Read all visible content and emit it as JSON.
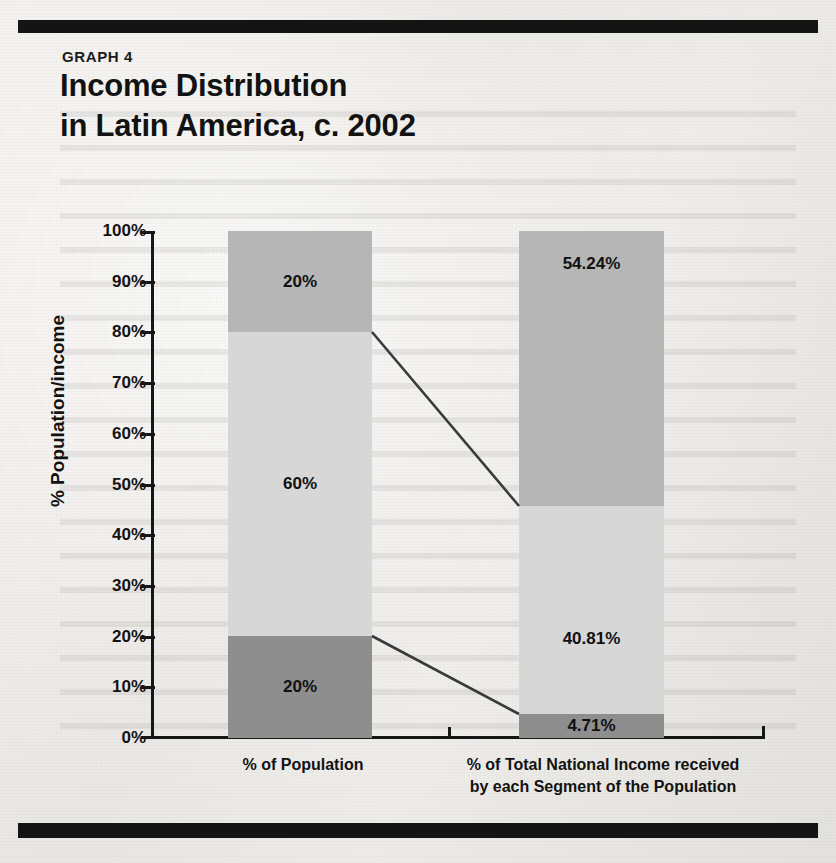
{
  "page": {
    "graph_label": "GRAPH 4",
    "title": "Income Distribution\nin Latin America, c. 2002"
  },
  "chart_data": {
    "type": "bar",
    "subtype": "stacked-bar",
    "title": "Income Distribution in Latin America, c. 2002",
    "xlabel": "",
    "ylabel": "% Population/income",
    "ylim": [
      0,
      100
    ],
    "ytick_labels": [
      "100%",
      "90%",
      "80%",
      "70%",
      "60%",
      "50%",
      "40%",
      "30%",
      "20%",
      "10%",
      "0%"
    ],
    "ytick_values": [
      100,
      90,
      80,
      70,
      60,
      50,
      40,
      30,
      20,
      10,
      0
    ],
    "grid": false,
    "legend": "none",
    "categories": [
      "% of Population",
      "% of Total National Income received\nby each Segment of the Population"
    ],
    "series": [
      {
        "name": "Bottom segment",
        "position": "bottom",
        "color": "#8e8e8e",
        "values": [
          20,
          4.71
        ],
        "labels": [
          "20%",
          "4.71%"
        ]
      },
      {
        "name": "Middle segment",
        "position": "middle",
        "color": "#d7d7d7",
        "values": [
          60,
          40.81
        ],
        "labels": [
          "60%",
          "40.81%"
        ]
      },
      {
        "name": "Top segment",
        "position": "top",
        "color": "#b6b6b6",
        "values": [
          20,
          54.24
        ],
        "labels": [
          "20%",
          "54.24%"
        ]
      }
    ],
    "connectors": [
      {
        "name": "upper-connector",
        "from_value": 80,
        "to_value": 45.52
      },
      {
        "name": "lower-connector",
        "from_value": 20,
        "to_value": 4.71
      }
    ],
    "colors": {
      "bar_top": "#b6b6b6",
      "bar_middle": "#d7d7d7",
      "bar_bottom": "#8e8e8e",
      "axis": "#161616",
      "text": "#121212",
      "rule": "#141414"
    }
  }
}
